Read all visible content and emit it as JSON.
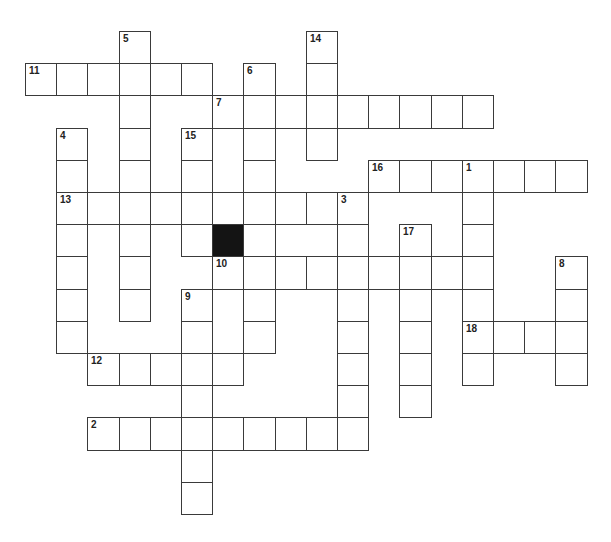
{
  "puzzle": {
    "grid": {
      "cols": 18,
      "rows": 15,
      "origin_x": 25,
      "origin_y": 31,
      "cell_width": 31.2,
      "cell_height": 32.2,
      "line_color": "#3a3a3a",
      "black_color": "#141414"
    },
    "black_cells": [
      {
        "row": 6,
        "col": 6
      }
    ],
    "entries": [
      {
        "number": "1",
        "direction": "down",
        "row": 4,
        "col": 14,
        "length": 7
      },
      {
        "number": "2",
        "direction": "across",
        "row": 12,
        "col": 2,
        "length": 9
      },
      {
        "number": "3",
        "direction": "down",
        "row": 5,
        "col": 10,
        "length": 8
      },
      {
        "number": "4",
        "direction": "down",
        "row": 3,
        "col": 1,
        "length": 7
      },
      {
        "number": "5",
        "direction": "down",
        "row": 0,
        "col": 3,
        "length": 9
      },
      {
        "number": "6",
        "direction": "down",
        "row": 1,
        "col": 7,
        "length": 9
      },
      {
        "number": "7",
        "direction": "across",
        "row": 2,
        "col": 6,
        "length": 9
      },
      {
        "number": "8",
        "direction": "down",
        "row": 7,
        "col": 17,
        "length": 4
      },
      {
        "number": "9",
        "direction": "down",
        "row": 8,
        "col": 5,
        "length": 7
      },
      {
        "number": "10",
        "direction": "across",
        "row": 7,
        "col": 6,
        "length": 9
      },
      {
        "number": "11",
        "direction": "across",
        "row": 1,
        "col": 0,
        "length": 6
      },
      {
        "number": "12",
        "direction": "across",
        "row": 10,
        "col": 2,
        "length": 5
      },
      {
        "number": "13",
        "direction": "across",
        "row": 5,
        "col": 1,
        "length": 10
      },
      {
        "number": "14",
        "direction": "down",
        "row": 0,
        "col": 9,
        "length": 4
      },
      {
        "number": "15",
        "direction": "down",
        "row": 3,
        "col": 5,
        "length": 4
      },
      {
        "number": "16",
        "direction": "across",
        "row": 4,
        "col": 11,
        "length": 7
      },
      {
        "number": "17",
        "direction": "down",
        "row": 6,
        "col": 12,
        "length": 6
      },
      {
        "number": "18",
        "direction": "across",
        "row": 9,
        "col": 14,
        "length": 4
      }
    ]
  }
}
